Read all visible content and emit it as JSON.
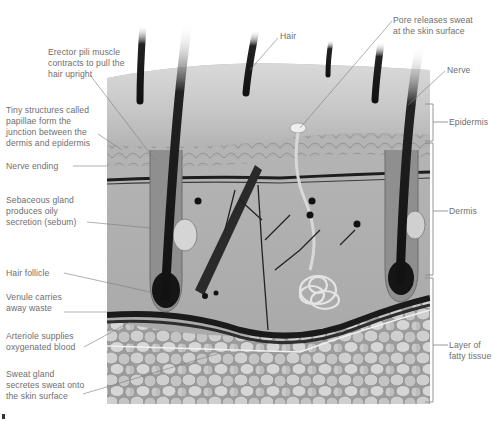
{
  "diagram": {
    "colors": {
      "label_text": "#6e6e6e",
      "leader_line": "#7a7a7a",
      "bracket": "#8c8c8c"
    }
  },
  "labels": {
    "erector": "Erector pili muscle\ncontracts to pull the\nhair upright",
    "papillae": "Tiny structures called\npapillae form the\njunction between the\ndermis and epidermis",
    "nerve_ending": "Nerve ending",
    "sebaceous": "Sebaceous gland\nproduces oily\nsecretion (sebum)",
    "hair_follicle": "Hair follicle",
    "venule": "Venule carries\naway waste",
    "arteriole": "Arteriole supplies\noxygenated blood",
    "sweat_gland": "Sweat gland\nsecretes sweat onto\nthe skin surface",
    "hair": "Hair",
    "pore": "Pore releases sweat\nat the skin surface",
    "nerve": "Nerve"
  },
  "layers": {
    "epidermis": "Epidermis",
    "dermis": "Dermis",
    "fatty": "Layer of\nfatty tissue"
  }
}
